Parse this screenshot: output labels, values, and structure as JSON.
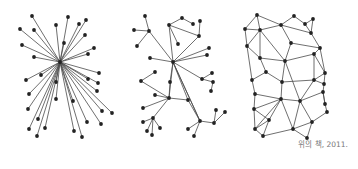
{
  "caption": "위의 책, 2011.",
  "colors": {
    "edge": "#4a4a4a",
    "node": "#222222",
    "caption": "#777777",
    "background": "#ffffff"
  },
  "networks": [
    {
      "name": "centralized",
      "nodes": [
        [
          60,
          62
        ],
        [
          32,
          16
        ],
        [
          68,
          17
        ],
        [
          86,
          20
        ],
        [
          79,
          24
        ],
        [
          56,
          25
        ],
        [
          20,
          29
        ],
        [
          34,
          30
        ],
        [
          85,
          35
        ],
        [
          64,
          43
        ],
        [
          22,
          45
        ],
        [
          94,
          48
        ],
        [
          88,
          54
        ],
        [
          34,
          57
        ],
        [
          99,
          73
        ],
        [
          41,
          75
        ],
        [
          26,
          80
        ],
        [
          88,
          79
        ],
        [
          98,
          83
        ],
        [
          56,
          82
        ],
        [
          97,
          91
        ],
        [
          29,
          94
        ],
        [
          56,
          99
        ],
        [
          73,
          101
        ],
        [
          112,
          113
        ],
        [
          28,
          109
        ],
        [
          102,
          111
        ],
        [
          38,
          119
        ],
        [
          87,
          122
        ],
        [
          101,
          124
        ],
        [
          45,
          128
        ],
        [
          29,
          129
        ],
        [
          74,
          131
        ],
        [
          37,
          136
        ],
        [
          82,
          137
        ]
      ],
      "edges": [
        [
          0,
          1
        ],
        [
          0,
          2
        ],
        [
          0,
          3
        ],
        [
          0,
          4
        ],
        [
          0,
          5
        ],
        [
          0,
          6
        ],
        [
          0,
          7
        ],
        [
          0,
          8
        ],
        [
          0,
          9
        ],
        [
          0,
          10
        ],
        [
          0,
          11
        ],
        [
          0,
          12
        ],
        [
          0,
          13
        ],
        [
          0,
          14
        ],
        [
          0,
          15
        ],
        [
          0,
          16
        ],
        [
          0,
          17
        ],
        [
          0,
          18
        ],
        [
          0,
          19
        ],
        [
          0,
          20
        ],
        [
          0,
          21
        ],
        [
          0,
          22
        ],
        [
          0,
          23
        ],
        [
          0,
          24
        ],
        [
          0,
          25
        ],
        [
          0,
          26
        ],
        [
          0,
          27
        ],
        [
          0,
          28
        ],
        [
          0,
          29
        ],
        [
          0,
          30
        ],
        [
          0,
          31
        ],
        [
          0,
          32
        ],
        [
          0,
          33
        ],
        [
          0,
          34
        ]
      ]
    },
    {
      "name": "decentralized",
      "nodes": [
        [
          173,
          62
        ],
        [
          169,
          25
        ],
        [
          149,
          31
        ],
        [
          169,
          98
        ],
        [
          200,
          121
        ],
        [
          153,
          118
        ],
        [
          188,
          100
        ],
        [
          202,
          79
        ],
        [
          199,
          36
        ],
        [
          141,
          81
        ],
        [
          170,
          82
        ],
        [
          214,
          123
        ],
        [
          145,
          16
        ],
        [
          134,
          30
        ],
        [
          137,
          46
        ],
        [
          182,
          18
        ],
        [
          193,
          24
        ],
        [
          200,
          21
        ],
        [
          178,
          44
        ],
        [
          150,
          58
        ],
        [
          207,
          55
        ],
        [
          209,
          48
        ],
        [
          212,
          73
        ],
        [
          213,
          82
        ],
        [
          211,
          91
        ],
        [
          155,
          95
        ],
        [
          143,
          108
        ],
        [
          143,
          122
        ],
        [
          147,
          131
        ],
        [
          160,
          128
        ],
        [
          152,
          135
        ],
        [
          188,
          129
        ],
        [
          194,
          136
        ],
        [
          216,
          110
        ],
        [
          225,
          112
        ],
        [
          155,
          72
        ]
      ],
      "edges": [
        [
          0,
          1
        ],
        [
          0,
          2
        ],
        [
          0,
          3
        ],
        [
          0,
          4
        ],
        [
          0,
          6
        ],
        [
          0,
          7
        ],
        [
          0,
          8
        ],
        [
          0,
          19
        ],
        [
          0,
          20
        ],
        [
          0,
          21
        ],
        [
          1,
          8
        ],
        [
          1,
          15
        ],
        [
          15,
          16
        ],
        [
          1,
          18
        ],
        [
          8,
          17
        ],
        [
          2,
          12
        ],
        [
          2,
          13
        ],
        [
          2,
          14
        ],
        [
          3,
          9
        ],
        [
          3,
          10
        ],
        [
          3,
          5
        ],
        [
          3,
          6
        ],
        [
          3,
          25
        ],
        [
          3,
          26
        ],
        [
          10,
          0
        ],
        [
          9,
          35
        ],
        [
          5,
          27
        ],
        [
          5,
          28
        ],
        [
          5,
          29
        ],
        [
          5,
          30
        ],
        [
          4,
          6
        ],
        [
          4,
          11
        ],
        [
          4,
          31
        ],
        [
          4,
          32
        ],
        [
          11,
          33
        ],
        [
          11,
          34
        ],
        [
          7,
          22
        ],
        [
          7,
          23
        ],
        [
          23,
          24
        ],
        [
          0,
          4
        ]
      ]
    },
    {
      "name": "distributed",
      "nodes": [
        [
          257,
          15
        ],
        [
          245,
          29
        ],
        [
          260,
          30
        ],
        [
          281,
          25
        ],
        [
          294,
          16
        ],
        [
          305,
          24
        ],
        [
          313,
          19
        ],
        [
          311,
          33
        ],
        [
          247,
          46
        ],
        [
          291,
          43
        ],
        [
          320,
          48
        ],
        [
          260,
          58
        ],
        [
          285,
          61
        ],
        [
          314,
          54
        ],
        [
          266,
          72
        ],
        [
          252,
          80
        ],
        [
          282,
          82
        ],
        [
          314,
          80
        ],
        [
          325,
          73
        ],
        [
          324,
          84
        ],
        [
          255,
          94
        ],
        [
          281,
          99
        ],
        [
          300,
          101
        ],
        [
          323,
          92
        ],
        [
          254,
          109
        ],
        [
          269,
          120
        ],
        [
          255,
          129
        ],
        [
          263,
          136
        ],
        [
          293,
          129
        ],
        [
          312,
          122
        ],
        [
          327,
          112
        ],
        [
          325,
          104
        ],
        [
          307,
          138
        ]
      ],
      "edges": [
        [
          0,
          1
        ],
        [
          0,
          2
        ],
        [
          0,
          3
        ],
        [
          1,
          2
        ],
        [
          1,
          8
        ],
        [
          2,
          3
        ],
        [
          2,
          8
        ],
        [
          2,
          11
        ],
        [
          2,
          12
        ],
        [
          3,
          4
        ],
        [
          3,
          9
        ],
        [
          3,
          7
        ],
        [
          4,
          5
        ],
        [
          5,
          6
        ],
        [
          5,
          7
        ],
        [
          6,
          7
        ],
        [
          7,
          10
        ],
        [
          9,
          12
        ],
        [
          9,
          10
        ],
        [
          10,
          13
        ],
        [
          10,
          18
        ],
        [
          11,
          12
        ],
        [
          11,
          14
        ],
        [
          12,
          13
        ],
        [
          12,
          16
        ],
        [
          12,
          22
        ],
        [
          13,
          17
        ],
        [
          13,
          18
        ],
        [
          14,
          15
        ],
        [
          14,
          16
        ],
        [
          15,
          20
        ],
        [
          16,
          21
        ],
        [
          16,
          17
        ],
        [
          17,
          18
        ],
        [
          17,
          19
        ],
        [
          17,
          22
        ],
        [
          18,
          19
        ],
        [
          19,
          23
        ],
        [
          20,
          21
        ],
        [
          20,
          24
        ],
        [
          21,
          22
        ],
        [
          21,
          24
        ],
        [
          21,
          25
        ],
        [
          21,
          26
        ],
        [
          21,
          28
        ],
        [
          22,
          23
        ],
        [
          22,
          28
        ],
        [
          22,
          29
        ],
        [
          23,
          31
        ],
        [
          24,
          25
        ],
        [
          24,
          26
        ],
        [
          25,
          26
        ],
        [
          25,
          27
        ],
        [
          26,
          27
        ],
        [
          27,
          28
        ],
        [
          28,
          29
        ],
        [
          28,
          32
        ],
        [
          29,
          30
        ],
        [
          29,
          32
        ],
        [
          30,
          31
        ],
        [
          31,
          23
        ],
        [
          8,
          15
        ],
        [
          8,
          11
        ]
      ]
    }
  ]
}
